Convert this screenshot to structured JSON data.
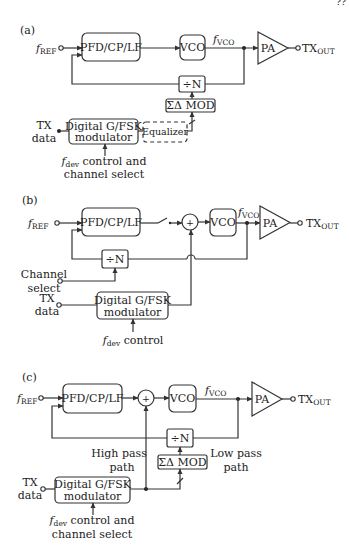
{
  "page_number": "??",
  "panels": {
    "a": {
      "label": "(a)",
      "f_ref": {
        "main": "f",
        "sub": "REF"
      },
      "pfd": "PFD/CP/LF",
      "vco": "VCO",
      "f_vco": {
        "main": "f",
        "sub": "VCO"
      },
      "pa": "PA",
      "tx_out": {
        "main": "TX",
        "sub": "OUT"
      },
      "divider": "÷N",
      "sdm": "ΣΔ MOD",
      "modulator": {
        "line1": "Digital G/FSK",
        "line2": "modulator"
      },
      "equalizer": "Equalizer",
      "tx_data": {
        "line1": "TX",
        "line2": "data"
      },
      "fdev": {
        "main": "f",
        "sub": "dev",
        "rest": " control and",
        "line2": "channel select"
      }
    },
    "b": {
      "label": "(b)",
      "f_ref": {
        "main": "f",
        "sub": "REF"
      },
      "pfd": "PFD/CP/LF",
      "summer": "+",
      "vco": "VCO",
      "f_vco": {
        "main": "f",
        "sub": "VCO"
      },
      "pa": "PA",
      "tx_out": {
        "main": "TX",
        "sub": "OUT"
      },
      "divider": "÷N",
      "channel_select": {
        "line1": "Channel",
        "line2": "select"
      },
      "modulator": {
        "line1": "Digital G/FSK",
        "line2": "modulator"
      },
      "tx_data": {
        "line1": "TX",
        "line2": "data"
      },
      "fdev": {
        "main": "f",
        "sub": "dev",
        "rest": " control"
      }
    },
    "c": {
      "label": "(c)",
      "f_ref": {
        "main": "f",
        "sub": "REF"
      },
      "pfd": "PFD/CP/LF",
      "summer": "+",
      "vco": "VCO",
      "f_vco": {
        "main": "f",
        "sub": "VCO"
      },
      "pa": "PA",
      "tx_out": {
        "main": "TX",
        "sub": "OUT"
      },
      "divider": "÷N",
      "sdm": "ΣΔ MOD",
      "high_pass": {
        "line1": "High pass",
        "line2": "path"
      },
      "low_pass": {
        "line1": "Low pass",
        "line2": "path"
      },
      "modulator": {
        "line1": "Digital G/FSK",
        "line2": "modulator"
      },
      "tx_data": {
        "line1": "TX",
        "line2": "data"
      },
      "fdev": {
        "main": "f",
        "sub": "dev",
        "rest": " control and",
        "line2": "channel select"
      }
    }
  }
}
